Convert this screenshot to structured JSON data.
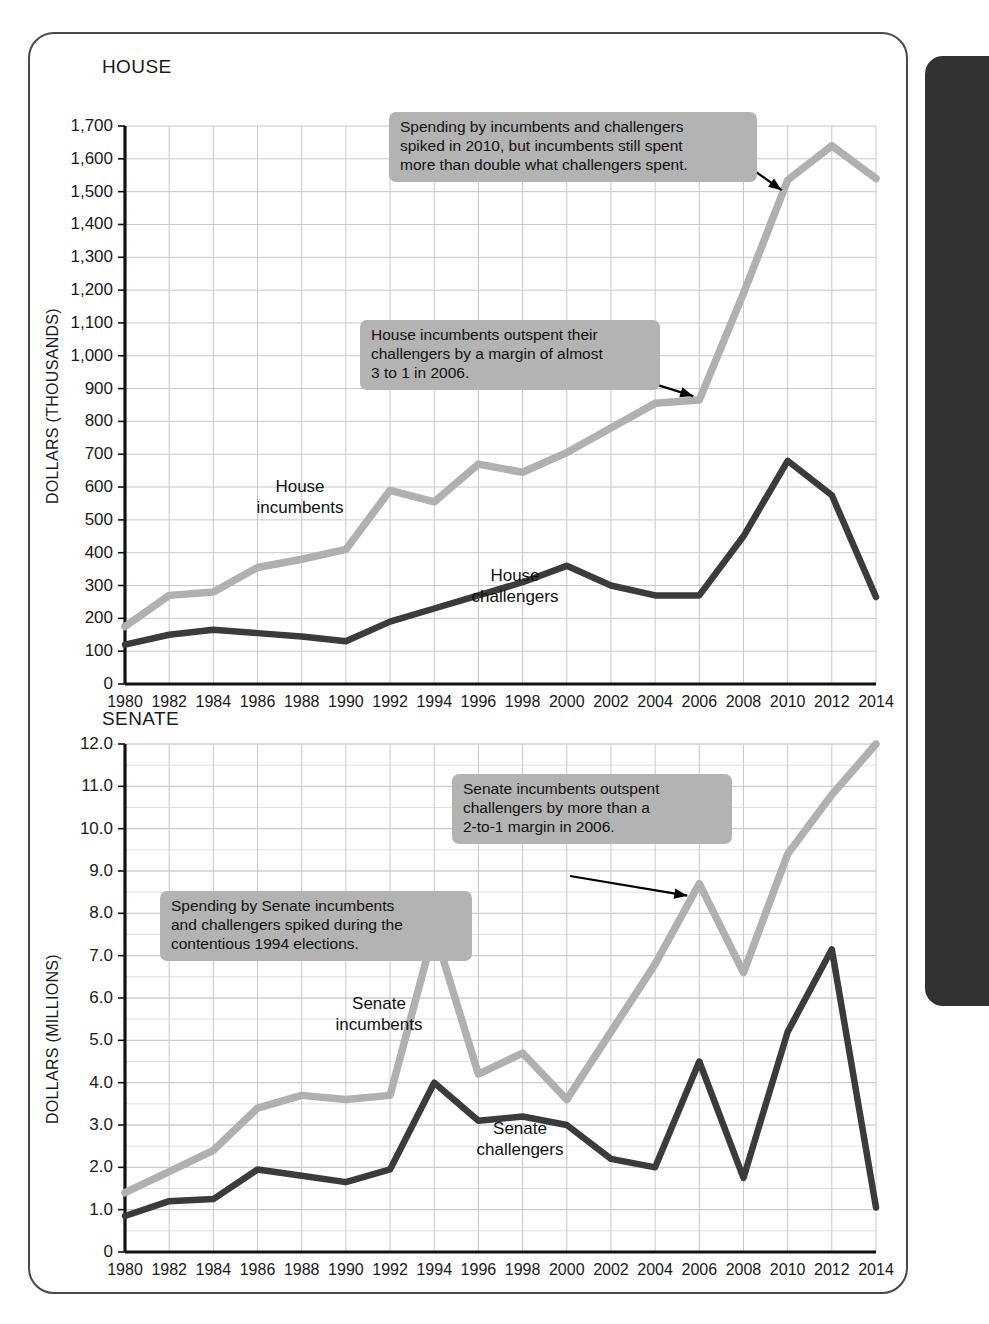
{
  "figure": {
    "panels": [
      {
        "id": "house",
        "title": "HOUSE",
        "ylabel": "DOLLARS (THOUSANDS)",
        "series_labels": [
          {
            "text": "House\nincumbents",
            "series": "incumbents"
          },
          {
            "text": "House\nchallengers",
            "series": "challengers"
          }
        ],
        "callouts": [
          {
            "text": "Spending by incumbents and challengers\nspiked in 2010, but incumbents still spent\nmore than double what challengers spent."
          },
          {
            "text": "House incumbents outspent their\nchallengers by a margin of almost\n3 to 1 in 2006."
          }
        ]
      },
      {
        "id": "senate",
        "title": "SENATE",
        "ylabel": "DOLLARS (MILLIONS)",
        "series_labels": [
          {
            "text": "Senate\nincumbents",
            "series": "incumbents"
          },
          {
            "text": "Senate\nchallengers",
            "series": "challengers"
          }
        ],
        "callouts": [
          {
            "text": "Senate incumbents outspent\nchallengers by more than a\n2-to-1 margin in 2006."
          },
          {
            "text": "Spending by Senate incumbents\nand challengers spiked during the\ncontentious 1994 elections."
          }
        ]
      }
    ],
    "colors": {
      "incumbents_line": "#b0b0b0",
      "challengers_line": "#3b3b3b",
      "grid": "#c8c8c8",
      "axis": "#111111",
      "callout_bg": "#b3b3b3",
      "page_edge": "#323232"
    }
  },
  "chart_data": [
    {
      "type": "line",
      "id": "house",
      "title": "HOUSE",
      "xlabel": "",
      "ylabel": "DOLLARS (THOUSANDS)",
      "ylim": [
        0,
        1700
      ],
      "ytick_step": 100,
      "ytick_labels": [
        "0",
        "100",
        "200",
        "300",
        "400",
        "500",
        "600",
        "700",
        "800",
        "900",
        "1,000",
        "1,100",
        "1,200",
        "1,300",
        "1,400",
        "1,500",
        "1,600",
        "1,700"
      ],
      "xlim": [
        1980,
        2014
      ],
      "x": [
        1980,
        1982,
        1984,
        1986,
        1988,
        1990,
        1992,
        1994,
        1996,
        1998,
        2000,
        2002,
        2004,
        2006,
        2008,
        2010,
        2012,
        2014
      ],
      "xtick_labels": [
        "1980",
        "1982",
        "1984",
        "1986",
        "1988",
        "1990",
        "1992",
        "1994",
        "1996",
        "1998",
        "2000",
        "2002",
        "2004",
        "2006",
        "2008",
        "2010",
        "2012",
        "2014"
      ],
      "grid": true,
      "legend": "inline-labels",
      "series": [
        {
          "name": "House incumbents",
          "color": "#b0b0b0",
          "values": [
            175,
            270,
            280,
            355,
            380,
            410,
            590,
            555,
            670,
            645,
            705,
            780,
            855,
            865,
            1190,
            1535,
            1640,
            1540
          ]
        },
        {
          "name": "House challengers",
          "color": "#3b3b3b",
          "values": [
            120,
            150,
            165,
            155,
            145,
            130,
            190,
            230,
            270,
            310,
            360,
            300,
            270,
            270,
            450,
            680,
            575,
            265
          ]
        }
      ],
      "annotations": [
        {
          "text": "Spending by incumbents and challengers spiked in 2010, but incumbents still spent more than double what challengers spent.",
          "points_to": {
            "x": 2010,
            "series": "House incumbents"
          }
        },
        {
          "text": "House incumbents outspent their challengers by a margin of almost 3 to 1 in 2006.",
          "points_to": {
            "x": 2006,
            "series": "House incumbents"
          }
        }
      ]
    },
    {
      "type": "line",
      "id": "senate",
      "title": "SENATE",
      "xlabel": "",
      "ylabel": "DOLLARS (MILLIONS)",
      "ylim": [
        0,
        12.0
      ],
      "ytick_step": 1.0,
      "minor_ytick_step": 0.5,
      "ytick_labels": [
        "0",
        "1.0",
        "2.0",
        "3.0",
        "4.0",
        "5.0",
        "6.0",
        "7.0",
        "8.0",
        "9.0",
        "10.0",
        "11.0",
        "12.0"
      ],
      "xlim": [
        1980,
        2014
      ],
      "x": [
        1980,
        1982,
        1984,
        1986,
        1988,
        1990,
        1992,
        1994,
        1996,
        1998,
        2000,
        2002,
        2004,
        2006,
        2008,
        2010,
        2012,
        2014
      ],
      "xtick_labels": [
        "1980",
        "1982",
        "1984",
        "1986",
        "1988",
        "1990",
        "1992",
        "1994",
        "1996",
        "1998",
        "2000",
        "2002",
        "2004",
        "2006",
        "2008",
        "2010",
        "2012",
        "2014"
      ],
      "grid": true,
      "legend": "inline-labels",
      "series": [
        {
          "name": "Senate incumbents",
          "color": "#b0b0b0",
          "values": [
            1.4,
            1.9,
            2.4,
            3.4,
            3.7,
            3.6,
            3.7,
            7.6,
            4.2,
            4.7,
            3.6,
            5.2,
            6.8,
            8.7,
            6.6,
            9.4,
            10.8,
            12.0
          ]
        },
        {
          "name": "Senate challengers",
          "color": "#3b3b3b",
          "values": [
            0.85,
            1.2,
            1.25,
            1.95,
            1.8,
            1.65,
            1.95,
            4.0,
            3.1,
            3.2,
            3.0,
            2.2,
            2.0,
            4.5,
            1.75,
            5.2,
            7.15,
            1.05
          ]
        }
      ],
      "annotations": [
        {
          "text": "Senate incumbents outspent challengers by more than a 2-to-1 margin in 2006.",
          "points_to": {
            "x": 2006,
            "series": "Senate incumbents"
          }
        },
        {
          "text": "Spending by Senate incumbents and challengers spiked during the contentious 1994 elections.",
          "points_to": {
            "x": 1994,
            "series": "Senate incumbents"
          }
        }
      ]
    }
  ]
}
